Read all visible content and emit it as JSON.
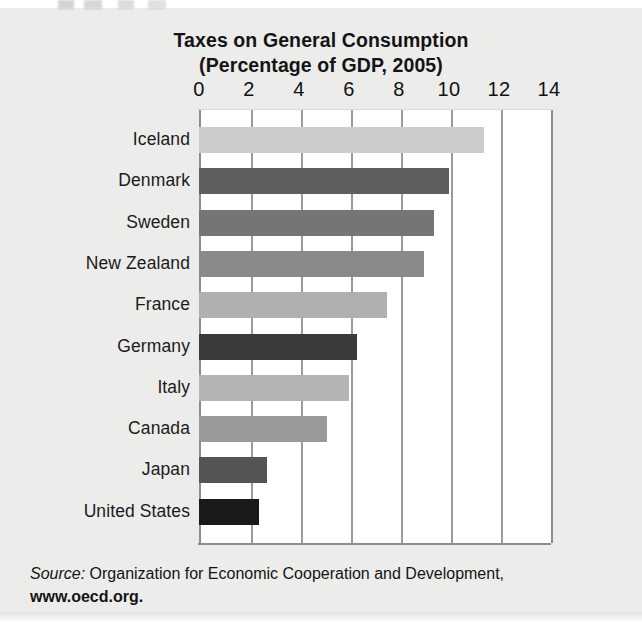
{
  "chart_data": {
    "type": "bar",
    "orientation": "horizontal",
    "title": "Taxes on General Consumption (Percentage of GDP, 2005)",
    "title_line1": "Taxes on General Consumption",
    "title_line2": "(Percentage of GDP, 2005)",
    "xlabel": "",
    "ylabel": "",
    "xlim": [
      0,
      14
    ],
    "xticks": [
      0,
      2,
      4,
      6,
      8,
      10,
      12,
      14
    ],
    "xtick_labels": [
      "0",
      "2",
      "4",
      "6",
      "8",
      "10",
      "12",
      "14"
    ],
    "grid": "vertical gridlines at every tick",
    "legend": "none",
    "categories": [
      "Iceland",
      "Denmark",
      "Sweden",
      "New Zealand",
      "France",
      "Germany",
      "Italy",
      "Canada",
      "Japan",
      "United States"
    ],
    "values": [
      11.4,
      10.0,
      9.4,
      9.0,
      7.5,
      6.3,
      6.0,
      5.1,
      2.7,
      2.4
    ],
    "bar_colors": [
      "#cccccc",
      "#5f5f5f",
      "#757575",
      "#8a8a8a",
      "#b0b0b0",
      "#3a3a3a",
      "#b4b4b4",
      "#9a9a9a",
      "#545454",
      "#1a1a1a"
    ],
    "bars": [
      {
        "category": "Iceland",
        "value": 11.4,
        "color": "#cccccc"
      },
      {
        "category": "Denmark",
        "value": 10.0,
        "color": "#5f5f5f"
      },
      {
        "category": "Sweden",
        "value": 9.4,
        "color": "#757575"
      },
      {
        "category": "New Zealand",
        "value": 9.0,
        "color": "#8a8a8a"
      },
      {
        "category": "France",
        "value": 7.5,
        "color": "#b0b0b0"
      },
      {
        "category": "Germany",
        "value": 6.3,
        "color": "#3a3a3a"
      },
      {
        "category": "Italy",
        "value": 6.0,
        "color": "#b4b4b4"
      },
      {
        "category": "Canada",
        "value": 5.1,
        "color": "#9a9a9a"
      },
      {
        "category": "Japan",
        "value": 2.7,
        "color": "#545454"
      },
      {
        "category": "United States",
        "value": 2.4,
        "color": "#1a1a1a"
      }
    ]
  },
  "source_note": {
    "label": "Source:",
    "text": " Organization for Economic Cooperation and Development,",
    "url": "www.oecd.org."
  }
}
